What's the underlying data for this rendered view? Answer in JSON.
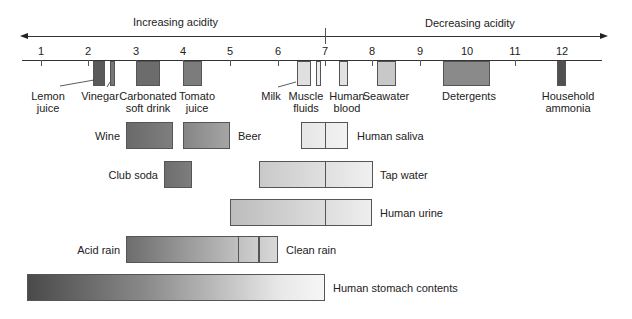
{
  "directions": {
    "left": "Increasing acidity",
    "right": "Decreasing acidity"
  },
  "axis": {
    "ticks": [
      "1",
      "2",
      "3",
      "4",
      "5",
      "6",
      "7",
      "8",
      "9",
      "10",
      "11",
      "12"
    ]
  },
  "substances": [
    {
      "label": "Lemon juice",
      "line1": "Lemon",
      "line2": "juice",
      "ph_min": 2.1,
      "ph_max": 2.35,
      "color": "#5a5a5a"
    },
    {
      "label": "Vinegar",
      "line1": "Vinegar",
      "line2": "",
      "ph_min": 2.45,
      "ph_max": 2.55,
      "color": "#777777"
    },
    {
      "label": "Carbonated soft drink",
      "line1": "Carbonated",
      "line2": "soft drink",
      "ph_min": 3.0,
      "ph_max": 3.5,
      "color": "#6c6c6c"
    },
    {
      "label": "Tomato juice",
      "line1": "Tomato",
      "line2": "juice",
      "ph_min": 4.0,
      "ph_max": 4.4,
      "color": "#7c7c7c"
    },
    {
      "label": "Milk",
      "line1": "Milk",
      "line2": "",
      "ph_min": 6.4,
      "ph_max": 6.7,
      "color": "#e0e0e0"
    },
    {
      "label": "Muscle fluids",
      "line1": "Muscle",
      "line2": "fluids",
      "ph_min": 6.8,
      "ph_max": 6.9,
      "color": "#ececec"
    },
    {
      "label": "Human blood",
      "line1": "Human",
      "line2": "blood",
      "ph_min": 7.3,
      "ph_max": 7.5,
      "color": "#e2e2e2"
    },
    {
      "label": "Seawater",
      "line1": "Seawater",
      "line2": "",
      "ph_min": 8.1,
      "ph_max": 8.5,
      "color": "#c8c8c8"
    },
    {
      "label": "Detergents",
      "line1": "Detergents",
      "line2": "",
      "ph_min": 9.5,
      "ph_max": 10.5,
      "color": "#8a8a8a"
    },
    {
      "label": "Household ammonia",
      "line1": "Household",
      "line2": "ammonia",
      "ph_min": 11.9,
      "ph_max": 12.1,
      "color": "#505050"
    }
  ],
  "ranges": [
    {
      "label": "Wine",
      "ph_min": 2.8,
      "ph_max": 3.8,
      "label_side": "left"
    },
    {
      "label": "Beer",
      "ph_min": 4.0,
      "ph_max": 5.0,
      "label_side": "right"
    },
    {
      "label": "Human saliva",
      "ph_min": 6.5,
      "ph_max": 7.5,
      "label_side": "right"
    },
    {
      "label": "Club soda",
      "ph_min": 3.6,
      "ph_max": 4.2,
      "label_side": "left"
    },
    {
      "label": "Tap water",
      "ph_min": 5.6,
      "ph_max": 8.0,
      "label_side": "right"
    },
    {
      "label": "Human urine",
      "ph_min": 5.0,
      "ph_max": 8.0,
      "label_side": "right"
    },
    {
      "label": "Acid rain",
      "ph_min": 2.8,
      "ph_max": 5.6,
      "label_side": "left"
    },
    {
      "label": "Clean rain",
      "ph_min": 5.6,
      "ph_max": 6.0,
      "label_side": "right"
    },
    {
      "label": "Human stomach contents",
      "ph_min": 0.7,
      "ph_max": 7.0,
      "label_side": "right"
    }
  ]
}
